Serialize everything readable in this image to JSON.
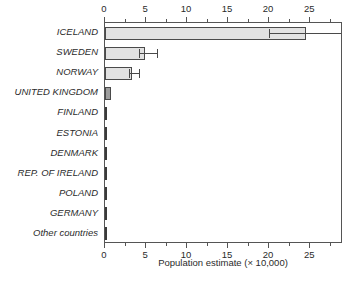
{
  "chart_data": {
    "type": "bar",
    "orientation": "horizontal",
    "title": "",
    "xlabel": "Population estimate (× 10,000)",
    "ylabel": "",
    "xlim": [
      0,
      29
    ],
    "ylim": null,
    "grid": false,
    "legend": null,
    "axes": {
      "top_axis": true,
      "bottom_axis": true,
      "major_ticks": [
        0,
        5,
        10,
        15,
        20,
        25
      ],
      "major_tick_labels": [
        "0",
        "5",
        "10",
        "15",
        "20",
        "25"
      ],
      "minor_tick_interval": 2.5,
      "minor_ticks": [
        2.5,
        7.5,
        12.5,
        17.5,
        22.5,
        27.5
      ]
    },
    "categories": [
      "ICELAND",
      "SWEDEN",
      "NORWAY",
      "UNITED KINGDOM",
      "FINLAND",
      "ESTONIA",
      "DENMARK",
      "REP. OF IRELAND",
      "POLAND",
      "GERMANY",
      "Other countries"
    ],
    "values": [
      24.5,
      4.9,
      3.3,
      0.75,
      0.06,
      0.06,
      0.06,
      0.04,
      0.04,
      0.04,
      0.04
    ],
    "error_bars": [
      {
        "category": "ICELAND",
        "low": 20.0,
        "high": 29.0,
        "clipped_high": true
      },
      {
        "category": "SWEDEN",
        "low": 4.1,
        "high": 6.3,
        "clipped_high": false
      },
      {
        "category": "NORWAY",
        "low": 2.9,
        "high": 4.2,
        "clipped_high": false
      }
    ],
    "bar_styles": [
      {
        "category": "ICELAND",
        "fill": "#e2e2e2"
      },
      {
        "category": "SWEDEN",
        "fill": "#e2e2e2"
      },
      {
        "category": "NORWAY",
        "fill": "#e2e2e2"
      },
      {
        "category": "UNITED KINGDOM",
        "fill": "#9e9e9e"
      },
      {
        "category": "FINLAND",
        "fill": "#3a3a3a"
      },
      {
        "category": "ESTONIA",
        "fill": "#3a3a3a"
      },
      {
        "category": "DENMARK",
        "fill": "#3a3a3a"
      },
      {
        "category": "REP. OF IRELAND",
        "fill": "#3a3a3a"
      },
      {
        "category": "POLAND",
        "fill": "#3a3a3a"
      },
      {
        "category": "GERMANY",
        "fill": "#3a3a3a"
      },
      {
        "category": "Other countries",
        "fill": "#3a3a3a"
      }
    ],
    "colors": {
      "bar_fill": "#e2e2e2",
      "bar_fill_highlight": "#9e9e9e",
      "bar_edge": "#4a4a4a",
      "axis": "#555555",
      "text": "#2b2b2b",
      "background": "#ffffff"
    }
  }
}
